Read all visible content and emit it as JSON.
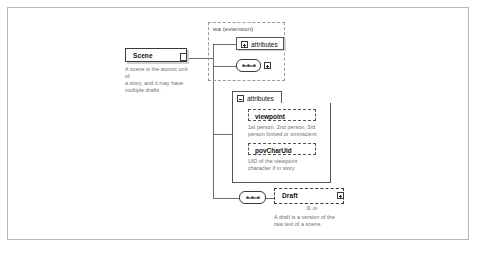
{
  "diagram": {
    "colors": {
      "frame_border": "#b8b8b8",
      "node_border": "#3a3a3a",
      "group_border": "#9a9a9a",
      "doc_text": "#6e6e6e",
      "background": "#ffffff"
    }
  },
  "scene": {
    "name": "Scene",
    "documentation": "A scene is the atomic unit of\na story, and it may have\nmultiple drafts.",
    "type_stub_icon": "type-stub-icon"
  },
  "extension_group": {
    "label": "wa (extension)"
  },
  "attributes_collapsed": {
    "label": "attributes",
    "toggle_icon": "expand-plus-icon",
    "state": "collapsed"
  },
  "sequence_top": {
    "icon": "sequence-compositor-icon",
    "toggle_icon": "expand-plus-icon"
  },
  "attributes_expanded": {
    "label": "attributes",
    "toggle_icon": "collapse-minus-icon",
    "state": "expanded",
    "items": [
      {
        "name": "viewpoint",
        "documentation": "1st person, 2nd person, 3rd\nperson limited or omniscient",
        "optional": true
      },
      {
        "name": "povCharUid",
        "documentation": "UID of the viewpoint\ncharacter if in story",
        "optional": true
      }
    ]
  },
  "sequence_bottom": {
    "icon": "sequence-compositor-icon"
  },
  "draft": {
    "name": "Draft",
    "documentation": "A draft is a version of the\nraw text of a scene.",
    "cardinality": "0..∞",
    "toggle_icon": "expand-plus-icon",
    "optional": true
  }
}
